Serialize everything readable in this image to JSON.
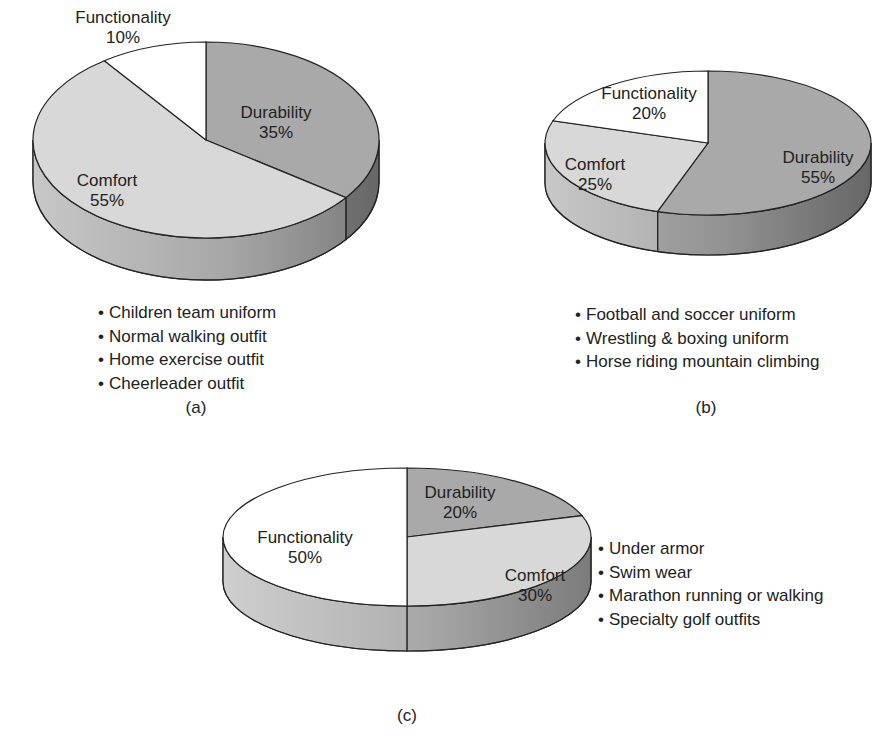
{
  "chart_data": [
    {
      "id": "a",
      "type": "pie",
      "title": "",
      "caption": "(a)",
      "categories": [
        "Durability",
        "Comfort",
        "Functionality"
      ],
      "values": [
        35,
        55,
        10
      ],
      "labels": [
        "Durability\n35%",
        "Comfort\n55%",
        "Functionality\n10%"
      ],
      "colors": {
        "Durability": "#a9a9a9",
        "Comfort": "#d8d8d8",
        "Functionality": "#ffffff"
      },
      "applications": [
        "Children team uniform",
        "Normal walking outfit",
        "Home exercise outfit",
        "Cheerleader outfit"
      ]
    },
    {
      "id": "b",
      "type": "pie",
      "title": "",
      "caption": "(b)",
      "categories": [
        "Durability",
        "Comfort",
        "Functionality"
      ],
      "values": [
        55,
        25,
        20
      ],
      "labels": [
        "Durability\n55%",
        "Comfort\n25%",
        "Functionality\n20%"
      ],
      "colors": {
        "Durability": "#a9a9a9",
        "Comfort": "#d8d8d8",
        "Functionality": "#ffffff"
      },
      "applications": [
        "Football and soccer uniform",
        "Wrestling & boxing uniform",
        "Horse riding mountain climbing"
      ]
    },
    {
      "id": "c",
      "type": "pie",
      "title": "",
      "caption": "(c)",
      "categories": [
        "Durability",
        "Comfort",
        "Functionality"
      ],
      "values": [
        20,
        30,
        50
      ],
      "labels": [
        "Durability\n20%",
        "Comfort\n30%",
        "Functionality\n50%"
      ],
      "colors": {
        "Durability": "#a9a9a9",
        "Comfort": "#d8d8d8",
        "Functionality": "#ffffff"
      },
      "applications": [
        "Under armor",
        "Swim wear",
        "Marathon running or walking",
        "Specialty golf outfits"
      ]
    }
  ],
  "charts": {
    "a": {
      "durability": {
        "name": "Durability",
        "pct": "35%"
      },
      "comfort": {
        "name": "Comfort",
        "pct": "55%"
      },
      "functionality": {
        "name": "Functionality",
        "pct": "10%"
      },
      "bullets": [
        "Children team uniform",
        "Normal walking outfit",
        "Home exercise outfit",
        "Cheerleader outfit"
      ],
      "caption": "(a)"
    },
    "b": {
      "durability": {
        "name": "Durability",
        "pct": "55%"
      },
      "comfort": {
        "name": "Comfort",
        "pct": "25%"
      },
      "functionality": {
        "name": "Functionality",
        "pct": "20%"
      },
      "bullets": [
        "Football and soccer uniform",
        "Wrestling & boxing uniform",
        "Horse riding mountain climbing"
      ],
      "caption": "(b)"
    },
    "c": {
      "durability": {
        "name": "Durability",
        "pct": "20%"
      },
      "comfort": {
        "name": "Comfort",
        "pct": "30%"
      },
      "functionality": {
        "name": "Functionality",
        "pct": "50%"
      },
      "bullets": [
        "Under armor",
        "Swim wear",
        "Marathon running or walking",
        "Specialty golf outfits"
      ],
      "caption": "(c)"
    }
  }
}
